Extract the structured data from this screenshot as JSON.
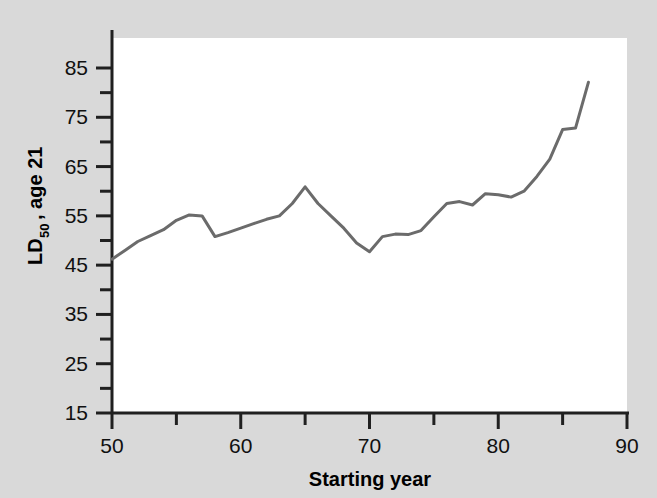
{
  "figure": {
    "background_color": "#d9d9d9",
    "plot_background_color": "#ffffff",
    "axis_color": "#202020",
    "line_color": "#6b6b6b"
  },
  "axes": {
    "x_title": "Starting year",
    "y_title_main": "LD",
    "y_title_sub": "50",
    "y_title_rest": ", age 21",
    "y_title_full": "LD50, age 21"
  },
  "chart_data": {
    "type": "line",
    "title": "",
    "xlabel": "Starting year",
    "ylabel": "LD50, age 21",
    "xlim": [
      50,
      90
    ],
    "ylim": [
      15,
      85
    ],
    "x_ticks": [
      50,
      60,
      70,
      80,
      90
    ],
    "x_tick_labels": [
      "50",
      "60",
      "70",
      "80",
      "90"
    ],
    "x_minor_ticks": [
      55,
      65,
      75,
      85
    ],
    "y_ticks": [
      15,
      25,
      35,
      45,
      55,
      65,
      75,
      85
    ],
    "y_tick_labels": [
      "15",
      "25",
      "35",
      "45",
      "55",
      "65",
      "75",
      "85"
    ],
    "y_minor_ticks": [
      20,
      30,
      40,
      50,
      60,
      70,
      80
    ],
    "grid": false,
    "legend": false,
    "series": [
      {
        "name": "LD50, age 21",
        "color": "#6b6b6b",
        "x": [
          50,
          51,
          52,
          53,
          54,
          55,
          56,
          57,
          58,
          59,
          60,
          61,
          62,
          63,
          64,
          65,
          66,
          67,
          68,
          69,
          70,
          71,
          72,
          73,
          74,
          75,
          76,
          77,
          78,
          79,
          80,
          81,
          82,
          83,
          84,
          85,
          86,
          87
        ],
        "values": [
          46.2,
          48.0,
          49.8,
          51.0,
          52.2,
          54.1,
          55.2,
          55.0,
          50.8,
          51.6,
          52.5,
          53.4,
          54.3,
          55.0,
          57.5,
          60.9,
          57.5,
          55.0,
          52.5,
          49.5,
          47.7,
          50.8,
          51.3,
          51.2,
          52.0,
          54.8,
          57.5,
          57.9,
          57.2,
          59.5,
          59.3,
          58.8,
          60.0,
          63.0,
          66.5,
          72.5,
          72.8,
          82.1
        ]
      }
    ]
  }
}
